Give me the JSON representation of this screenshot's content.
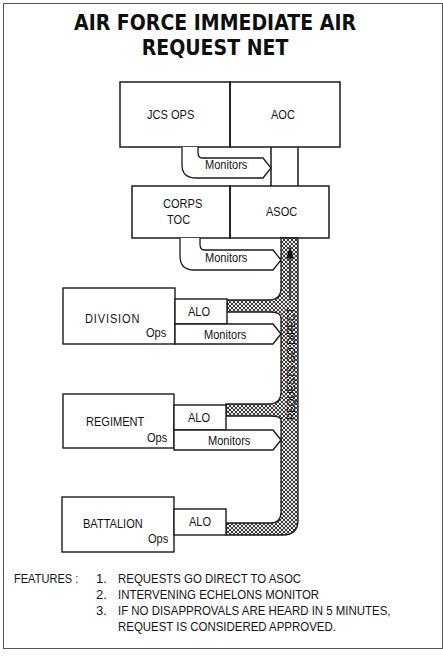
{
  "title": "AIR FORCE IMMEDIATE AIR REQUEST NET",
  "nodes": {
    "jcs_ops": "JCS OPS",
    "aoc": "AOC",
    "corps_toc_line1": "CORPS",
    "corps_toc_line2": "TOC",
    "asoc": "ASOC",
    "division": "DIVISION",
    "regiment": "REGIMENT",
    "battalion": "BATTALION",
    "ops": "Ops",
    "alo": "ALO"
  },
  "arrows": {
    "monitors": "Monitors",
    "requests_channel": "REQUESTS GO DIRECT"
  },
  "features": {
    "heading": "FEATURES :",
    "items": [
      {
        "num": "1.",
        "text": "REQUESTS GO DIRECT TO ASOC"
      },
      {
        "num": "2.",
        "text": "INTERVENING ECHELONS MONITOR"
      },
      {
        "num": "3.",
        "text": "IF NO DISAPPROVALS ARE HEARD IN 5 MINUTES,"
      },
      {
        "num": "",
        "text": "REQUEST IS CONSIDERED APPROVED."
      }
    ]
  },
  "colors": {
    "line": "#1a1a1a",
    "hatch": "#555555",
    "background": "#ffffff"
  }
}
